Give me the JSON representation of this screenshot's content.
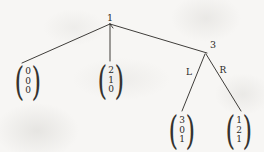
{
  "diagram": {
    "background_color": "#f7f6f4",
    "ink_color": "#2a2825",
    "nodes": [
      {
        "id": "root",
        "label": "1",
        "x": 110,
        "y": 18
      },
      {
        "id": "right-child",
        "label": "3",
        "x": 213,
        "y": 45
      }
    ],
    "edge_labels": [
      {
        "id": "left-branch",
        "label": "L",
        "x": 189,
        "y": 72
      },
      {
        "id": "right-branch",
        "label": "R",
        "x": 223,
        "y": 70
      }
    ],
    "edges": [
      {
        "id": "root-to-leaf-a",
        "x1": 110,
        "y1": 24,
        "x2": 22,
        "y2": 63
      },
      {
        "id": "root-to-leaf-b",
        "x1": 110,
        "y1": 24,
        "x2": 110,
        "y2": 61
      },
      {
        "id": "root-to-node-3",
        "x1": 110,
        "y1": 24,
        "x2": 207,
        "y2": 53
      },
      {
        "id": "node3-to-leaf-l",
        "x1": 205,
        "y1": 54,
        "x2": 182,
        "y2": 111
      },
      {
        "id": "node3-to-leaf-r",
        "x1": 206,
        "y1": 54,
        "x2": 241,
        "y2": 111
      },
      {
        "id": "root-tick",
        "x1": 110,
        "y1": 24,
        "x2": 113,
        "y2": 28
      }
    ],
    "vectors": [
      {
        "id": "leaf-a",
        "x": 28,
        "y": 81,
        "values": [
          "0",
          "0",
          "0"
        ]
      },
      {
        "id": "leaf-b",
        "x": 111,
        "y": 80,
        "values": [
          "2",
          "1",
          "0"
        ]
      },
      {
        "id": "leaf-l",
        "x": 182,
        "y": 130,
        "values": [
          "3",
          "0",
          "1"
        ]
      },
      {
        "id": "leaf-r",
        "x": 239,
        "y": 130,
        "values": [
          "1",
          "2",
          "1"
        ]
      }
    ]
  }
}
